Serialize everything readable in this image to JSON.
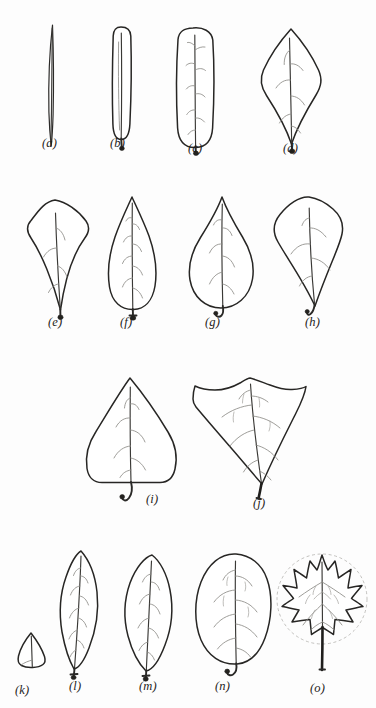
{
  "plate": {
    "kind": "botanical-line-drawing-plate",
    "background_color": "#fdfdfd",
    "ink_color": "#272624",
    "vein_color": "#8d8b87",
    "rows": 4,
    "figure_count": 15
  },
  "figures": [
    {
      "key": "a",
      "label": "(a)",
      "shape_name": "linear",
      "row": 1,
      "label_x": 42,
      "label_y": 143
    },
    {
      "key": "b",
      "label": "(b)",
      "shape_name": "linear-oblong",
      "row": 1,
      "label_x": 110,
      "label_y": 143
    },
    {
      "key": "c",
      "label": "(c)",
      "shape_name": "oblong",
      "row": 1,
      "label_x": 188,
      "label_y": 148
    },
    {
      "key": "d",
      "label": "(d)",
      "shape_name": "rhombic",
      "row": 1,
      "label_x": 283,
      "label_y": 148
    },
    {
      "key": "e",
      "label": "(e)",
      "shape_name": "obovate-rhombic",
      "row": 2,
      "label_x": 48,
      "label_y": 322
    },
    {
      "key": "f",
      "label": "(f)",
      "shape_name": "obovate-acuminate",
      "row": 2,
      "label_x": 120,
      "label_y": 322
    },
    {
      "key": "g",
      "label": "(g)",
      "shape_name": "broadly-obovate",
      "row": 2,
      "label_x": 205,
      "label_y": 322
    },
    {
      "key": "h",
      "label": "(h)",
      "shape_name": "broad-rhombic-obovate",
      "row": 2,
      "label_x": 305,
      "label_y": 322
    },
    {
      "key": "i",
      "label": "(i)",
      "shape_name": "deltoid",
      "row": 3,
      "label_x": 146,
      "label_y": 499
    },
    {
      "key": "j",
      "label": "(j)",
      "shape_name": "lobed-deltoid-truncate",
      "row": 3,
      "label_x": 253,
      "label_y": 503
    },
    {
      "key": "k",
      "label": "(k)",
      "shape_name": "scale-truncate",
      "row": 4,
      "label_x": 15,
      "label_y": 690
    },
    {
      "key": "l",
      "label": "(l)",
      "shape_name": "elliptic-lanceolate",
      "row": 4,
      "label_x": 69,
      "label_y": 686
    },
    {
      "key": "m",
      "label": "(m)",
      "shape_name": "elliptic",
      "row": 4,
      "label_x": 139,
      "label_y": 686
    },
    {
      "key": "n",
      "label": "(n)",
      "shape_name": "orbicular-oval",
      "row": 4,
      "label_x": 215,
      "label_y": 686
    },
    {
      "key": "o",
      "label": "(o)",
      "shape_name": "palmately-lobed-orbicular",
      "row": 4,
      "label_x": 310,
      "label_y": 688
    }
  ]
}
